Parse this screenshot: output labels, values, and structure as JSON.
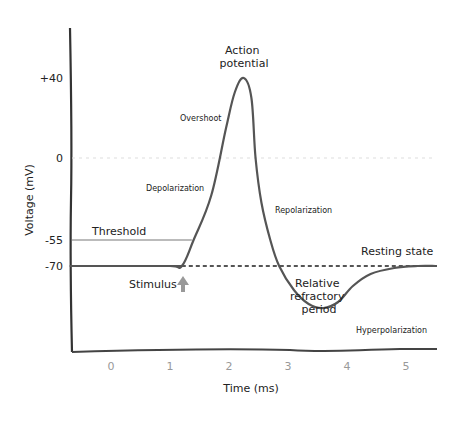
{
  "chart_data": {
    "type": "line",
    "title": "",
    "xlabel": "Time (ms)",
    "ylabel": "Voltage (mV)",
    "xlim": [
      -0.7,
      5.5
    ],
    "ylim": [
      -110,
      60
    ],
    "x_ticks": [
      0,
      1,
      2,
      3,
      4,
      5
    ],
    "x_tick_labels": [
      "0",
      "1",
      "2",
      "3",
      "4",
      "5"
    ],
    "y_ticks": [
      40,
      0,
      -55,
      -70
    ],
    "y_tick_labels": [
      "+40",
      "0",
      "-55",
      "-70"
    ],
    "grid": false,
    "series": [
      {
        "name": "Membrane potential",
        "color": "#555555",
        "x": [
          -0.7,
          0,
          1,
          1.2,
          1.4,
          1.7,
          1.95,
          2.1,
          2.25,
          2.38,
          2.45,
          2.55,
          2.7,
          2.85,
          3.1,
          3.35,
          3.6,
          3.85,
          4.1,
          4.4,
          4.8,
          5.2,
          5.5
        ],
        "y": [
          -70,
          -70,
          -70,
          -70,
          -55,
          -25,
          15,
          33,
          40,
          30,
          0,
          -30,
          -55,
          -70,
          -82,
          -89,
          -91,
          -88,
          -80,
          -74,
          -71,
          -70,
          -70
        ]
      }
    ],
    "reference_lines": [
      {
        "name": "zero-line",
        "y": 0,
        "style": "dotted",
        "color": "#dddddd"
      },
      {
        "name": "threshold-line",
        "y": -55,
        "style": "solid",
        "color": "#bbbbbb",
        "label": "Threshold"
      },
      {
        "name": "resting-line",
        "y": -70,
        "style": "dashed",
        "color": "#555555",
        "label": "Resting state"
      }
    ],
    "annotations": [
      {
        "name": "action-potential",
        "text_lines": [
          "Action",
          "potential"
        ]
      },
      {
        "name": "overshoot",
        "text": "Overshoot"
      },
      {
        "name": "depolarization",
        "text": "Depolarization"
      },
      {
        "name": "repolarization",
        "text": "Repolarization"
      },
      {
        "name": "threshold",
        "text": "Threshold"
      },
      {
        "name": "resting-state",
        "text": "Resting state"
      },
      {
        "name": "stimulus",
        "text": "Stimulus"
      },
      {
        "name": "relative-refractory-period",
        "text_lines": [
          "Relative",
          "refractory",
          "period"
        ]
      },
      {
        "name": "hyperpolarization",
        "text": "Hyperpolarization"
      }
    ]
  }
}
